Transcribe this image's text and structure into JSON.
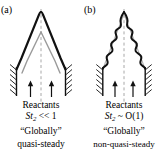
{
  "figure": {
    "type": "diagram",
    "background_color": "#ffffff",
    "ink_color": "#000000",
    "secondary_flame_color": "#9a9a9a",
    "centerline_color": "#a8a8a8"
  },
  "panels": [
    {
      "id": "a",
      "label": "(a)",
      "flame_shape": "smooth-conical",
      "flame_outlines": [
        {
          "name": "instantaneous-flame-front",
          "color": "#111111",
          "width": 2.2
        },
        {
          "name": "mean-flame-front",
          "color": "#9a9a9a",
          "width": 1.4
        }
      ],
      "centerline": "dashed",
      "burner_walls": "hatched",
      "inflow_arrows": 2,
      "captions": {
        "reactants": "Reactants",
        "stokes_symbol": "St",
        "stokes_subscript": "2",
        "stokes_relation": "<< 1",
        "stokes_full": "St2 << 1",
        "global_word": "“Globally”",
        "regime": "quasi-steady"
      }
    },
    {
      "id": "b",
      "label": "(b)",
      "flame_shape": "wrinkled-corrugated",
      "flame_outlines": [
        {
          "name": "instantaneous-flame-front",
          "color": "#111111",
          "width": 2.0
        },
        {
          "name": "mean-flame-front",
          "color": "#9a9a9a",
          "width": 1.2
        }
      ],
      "centerline": "dashed",
      "burner_walls": "hatched",
      "inflow_arrows": 2,
      "captions": {
        "reactants": "Reactants",
        "stokes_symbol": "St",
        "stokes_subscript": "2",
        "stokes_relation": "~ O(1)",
        "stokes_full": "St2 ~ O(1)",
        "global_word": "“Globally”",
        "regime": "non-quasi-steady"
      }
    }
  ]
}
